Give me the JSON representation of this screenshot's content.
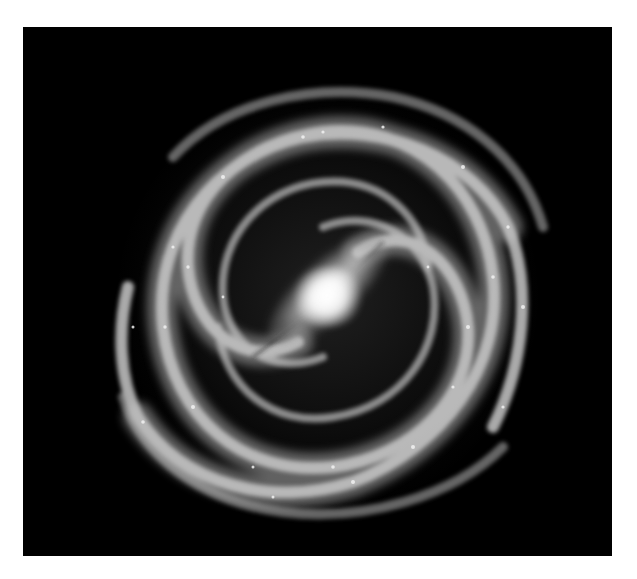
{
  "image": {
    "subject": "barred spiral galaxy",
    "style": "grayscale",
    "background_color": "#000000",
    "page_background_color": "#ffffff",
    "core_color": "#ffffff",
    "arm_color": "#bdbdbd"
  }
}
